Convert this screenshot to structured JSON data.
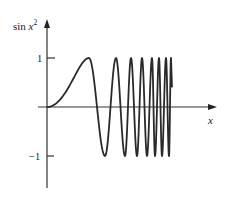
{
  "chart_data": {
    "type": "line",
    "title": "",
    "xlabel": "x",
    "ylabel": "sin x²",
    "ylabel_parts": {
      "base": "sin ",
      "var": "x",
      "sup": "2"
    },
    "function": "y = sin(x^2)",
    "y_ticks": [
      {
        "value": 1,
        "label": "1"
      },
      {
        "value": -1,
        "label": "−1"
      }
    ],
    "ylim": [
      -1,
      1
    ],
    "x_ticks": [],
    "grid": false,
    "legend": null,
    "series": [
      {
        "name": "sin x²",
        "description": "Starts flat at origin, rises to first peak, then oscillates between 1 and -1 with increasing frequency",
        "extrema_px": [
          {
            "x": 89,
            "y": 1
          },
          {
            "x": 105,
            "y": -1
          },
          {
            "x": 116,
            "y": 1
          },
          {
            "x": 125,
            "y": -1
          },
          {
            "x": 131,
            "y": 1
          },
          {
            "x": 137,
            "y": -1
          },
          {
            "x": 142,
            "y": 1
          },
          {
            "x": 147,
            "y": -1
          },
          {
            "x": 152,
            "y": 1
          },
          {
            "x": 155,
            "y": -1
          },
          {
            "x": 159,
            "y": 1
          },
          {
            "x": 162,
            "y": -1
          },
          {
            "x": 166,
            "y": 1
          },
          {
            "x": 169,
            "y": -1
          },
          {
            "x": 171,
            "y": 1
          }
        ],
        "end_px": {
          "x": 172,
          "y": 0.4
        }
      }
    ]
  },
  "axes": {
    "origin_px": {
      "x": 47,
      "y": 107
    },
    "unit_y_px": 49,
    "x_axis_end_px": 216,
    "x_axis_start_px": 38,
    "y_axis_top_px": 20,
    "y_axis_bottom_px": 188
  },
  "labels": {
    "y_axis": "sin",
    "y_axis_var": "x",
    "y_axis_sup": "2",
    "x_axis": "x",
    "tick_pos": "1",
    "tick_neg": "−1"
  },
  "colors": {
    "curve": "#2a2a2a",
    "axis": "#333333",
    "text": "#222222",
    "background": "#ffffff"
  }
}
